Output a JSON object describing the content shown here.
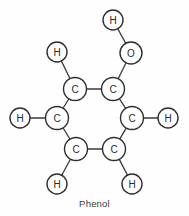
{
  "figure": {
    "caption": "Phenol",
    "caption_x": 94,
    "caption_y": 198,
    "background_color": "#fefefe",
    "stroke_color": "#2e2e2e",
    "bond_color": "#3a3a3a",
    "text_color": "#2a2a2a",
    "width": 189,
    "height": 216
  },
  "atoms": [
    {
      "id": "c1",
      "element": "C",
      "label": "C",
      "x": 75,
      "y": 89,
      "r": 11.5,
      "role": "ring-carbon"
    },
    {
      "id": "c2",
      "element": "C",
      "label": "C",
      "x": 113,
      "y": 89,
      "r": 11.5,
      "role": "ring-carbon-hydroxyl"
    },
    {
      "id": "c3",
      "element": "C",
      "label": "C",
      "x": 132,
      "y": 118,
      "r": 11.5,
      "role": "ring-carbon"
    },
    {
      "id": "c4",
      "element": "C",
      "label": "C",
      "x": 114,
      "y": 149,
      "r": 11.5,
      "role": "ring-carbon"
    },
    {
      "id": "c5",
      "element": "C",
      "label": "C",
      "x": 76,
      "y": 149,
      "r": 11.5,
      "role": "ring-carbon"
    },
    {
      "id": "c6",
      "element": "C",
      "label": "C",
      "x": 57,
      "y": 118,
      "r": 11.5,
      "role": "ring-carbon"
    },
    {
      "id": "o1",
      "element": "O",
      "label": "O",
      "x": 131,
      "y": 53,
      "r": 11.0,
      "role": "hydroxyl-oxygen"
    },
    {
      "id": "h1",
      "element": "H",
      "label": "H",
      "x": 113,
      "y": 20,
      "r": 10.0,
      "role": "hydroxyl-hydrogen"
    },
    {
      "id": "h2",
      "element": "H",
      "label": "H",
      "x": 57,
      "y": 52,
      "r": 10.0,
      "role": "ring-hydrogen"
    },
    {
      "id": "h3",
      "element": "H",
      "label": "H",
      "x": 20,
      "y": 118,
      "r": 10.0,
      "role": "ring-hydrogen"
    },
    {
      "id": "h4",
      "element": "H",
      "label": "H",
      "x": 168,
      "y": 118,
      "r": 10.0,
      "role": "ring-hydrogen"
    },
    {
      "id": "h5",
      "element": "H",
      "label": "H",
      "x": 57,
      "y": 184,
      "r": 10.0,
      "role": "ring-hydrogen"
    },
    {
      "id": "h6",
      "element": "H",
      "label": "H",
      "x": 132,
      "y": 184,
      "r": 10.0,
      "role": "ring-hydrogen"
    }
  ],
  "bonds": [
    {
      "id": "b-c1-c2",
      "from": "c1",
      "to": "c2",
      "order": 1
    },
    {
      "id": "b-c2-c3",
      "from": "c2",
      "to": "c3",
      "order": 1
    },
    {
      "id": "b-c3-c4",
      "from": "c3",
      "to": "c4",
      "order": 1
    },
    {
      "id": "b-c4-c5",
      "from": "c4",
      "to": "c5",
      "order": 1
    },
    {
      "id": "b-c5-c6",
      "from": "c5",
      "to": "c6",
      "order": 1
    },
    {
      "id": "b-c6-c1",
      "from": "c6",
      "to": "c1",
      "order": 1
    },
    {
      "id": "b-c2-o1",
      "from": "c2",
      "to": "o1",
      "order": 1
    },
    {
      "id": "b-o1-h1",
      "from": "o1",
      "to": "h1",
      "order": 1
    },
    {
      "id": "b-c1-h2",
      "from": "c1",
      "to": "h2",
      "order": 1
    },
    {
      "id": "b-c6-h3",
      "from": "c6",
      "to": "h3",
      "order": 1
    },
    {
      "id": "b-c3-h4",
      "from": "c3",
      "to": "h4",
      "order": 1
    },
    {
      "id": "b-c5-h5",
      "from": "c5",
      "to": "h5",
      "order": 1
    },
    {
      "id": "b-c4-h6",
      "from": "c4",
      "to": "h6",
      "order": 1
    }
  ]
}
